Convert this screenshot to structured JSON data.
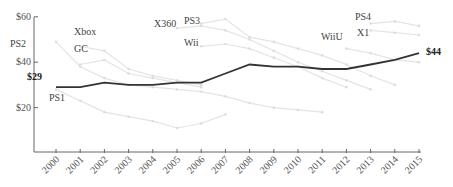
{
  "chart_data": {
    "type": "line",
    "title": "",
    "xlabel": "",
    "ylabel": "",
    "ylim": [
      0,
      60
    ],
    "grid": false,
    "x": [
      2000,
      2001,
      2002,
      2003,
      2004,
      2005,
      2006,
      2007,
      2008,
      2009,
      2010,
      2011,
      2012,
      2013,
      2014,
      2015
    ],
    "y_ticks": [
      "$20",
      "$40",
      "$60"
    ],
    "y_tick_values": [
      20,
      40,
      60
    ],
    "highlight_series": {
      "name": "Average",
      "color": "#333333",
      "values": [
        29,
        29,
        31,
        30,
        30,
        31,
        31,
        35,
        39,
        38,
        38,
        37,
        37,
        39,
        41,
        44
      ],
      "start_label": "$29",
      "end_label": "$44"
    },
    "series": [
      {
        "name": "PS2",
        "x": [
          2000,
          2001,
          2002,
          2003,
          2004,
          2005,
          2006,
          2007,
          2008,
          2009,
          2010,
          2011
        ],
        "values": [
          49,
          38,
          33,
          30,
          29,
          28,
          27,
          25,
          22,
          20,
          19,
          18
        ]
      },
      {
        "name": "Xbox",
        "x": [
          2001,
          2002,
          2003,
          2004,
          2005,
          2006
        ],
        "values": [
          47,
          45,
          37,
          34,
          32,
          30
        ]
      },
      {
        "name": "GC",
        "x": [
          2001,
          2002,
          2003,
          2004,
          2005,
          2006
        ],
        "values": [
          39,
          41,
          35,
          33,
          31,
          29
        ]
      },
      {
        "name": "PS1",
        "x": [
          2000,
          2001,
          2002,
          2003,
          2004,
          2005,
          2006,
          2007
        ],
        "values": [
          28,
          23,
          18,
          16,
          14,
          11,
          13,
          17
        ]
      },
      {
        "name": "X360",
        "x": [
          2005,
          2006,
          2007,
          2008,
          2009,
          2010,
          2011,
          2012,
          2013
        ],
        "values": [
          55,
          56,
          54,
          50,
          45,
          40,
          36,
          32,
          28
        ]
      },
      {
        "name": "PS3",
        "x": [
          2006,
          2007,
          2008,
          2009,
          2010,
          2011,
          2012,
          2013,
          2014
        ],
        "values": [
          57,
          59,
          51,
          49,
          46,
          43,
          39,
          34,
          30
        ]
      },
      {
        "name": "Wii",
        "x": [
          2006,
          2007,
          2008,
          2009,
          2010,
          2011,
          2012
        ],
        "values": [
          47,
          48,
          46,
          42,
          38,
          33,
          29
        ]
      },
      {
        "name": "WiiU",
        "x": [
          2012,
          2013,
          2014,
          2015
        ],
        "values": [
          46,
          44,
          41,
          40
        ]
      },
      {
        "name": "PS4",
        "x": [
          2013,
          2014,
          2015
        ],
        "values": [
          57,
          58,
          56
        ]
      },
      {
        "name": "X1",
        "x": [
          2013,
          2014,
          2015
        ],
        "values": [
          54,
          53,
          52
        ]
      }
    ],
    "labels": {
      "PS2": "PS2",
      "Xbox": "Xbox",
      "GC": "GC",
      "PS1": "PS1",
      "X360": "X360",
      "PS3": "PS3",
      "Wii": "Wii",
      "WiiU": "WiiU",
      "PS4": "PS4",
      "X1": "X1"
    }
  }
}
